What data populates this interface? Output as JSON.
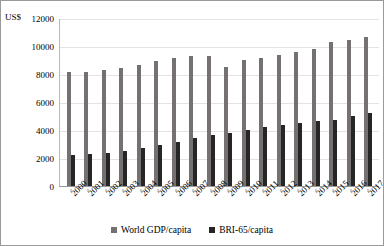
{
  "axis": {
    "unit_label": "US$",
    "y_ticks": [
      "12000",
      "10000",
      "8000",
      "6000",
      "4000",
      "2000",
      "0"
    ]
  },
  "legend": {
    "items": [
      {
        "label": "World GDP/capita",
        "color": "#767171",
        "marker": "square-marker"
      },
      {
        "label": "BRI-65/capita",
        "color": "#262626",
        "marker": "square-marker"
      }
    ]
  },
  "chart_data": {
    "type": "bar",
    "title": "",
    "xlabel": "",
    "ylabel": "US$",
    "ylim": [
      0,
      12000
    ],
    "ytick_step": 2000,
    "grid": true,
    "legend_position": "bottom",
    "categories": [
      "2000",
      "2001",
      "2002",
      "2003",
      "2004",
      "2005",
      "2006",
      "2007",
      "2008",
      "2009",
      "2010",
      "2011",
      "2012",
      "2013",
      "2014",
      "2015",
      "2016",
      "2017"
    ],
    "series": [
      {
        "name": "World GDP/capita",
        "color": "#767171",
        "values": [
          8200,
          8200,
          8350,
          8500,
          8750,
          9000,
          9200,
          9350,
          9350,
          8600,
          9050,
          9250,
          9450,
          9650,
          9850,
          10350,
          10500,
          10700
        ]
      },
      {
        "name": "BRI-65/capita",
        "color": "#262626",
        "values": [
          2300,
          2350,
          2450,
          2600,
          2800,
          3000,
          3200,
          3500,
          3700,
          3850,
          4050,
          4300,
          4450,
          4600,
          4750,
          4800,
          5050,
          5300
        ]
      }
    ]
  }
}
